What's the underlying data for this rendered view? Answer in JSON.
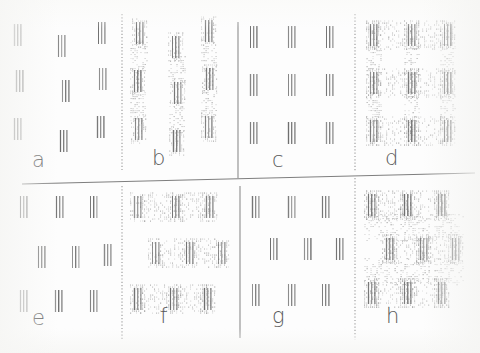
{
  "figure": {
    "width": 480,
    "height": 353,
    "background_color": "#fdfdfd",
    "element_stroke_color": "#6d6d6d",
    "connector_dot_color": "#b9b9b9",
    "divider_color": "#8d8d8d",
    "label_color": "#5a5a5a"
  },
  "dividers": {
    "vertical_dotted_left": {
      "x": 122,
      "y1": 14,
      "y2": 170,
      "style": "dotted"
    },
    "vertical_solid_center_top": {
      "x": 238,
      "y1": 22,
      "y2": 178,
      "style": "solid"
    },
    "vertical_dotted_right_top": {
      "x": 355,
      "y1": 14,
      "y2": 172,
      "style": "dotted"
    },
    "vertical_dotted_left_bottom": {
      "x": 122,
      "y1": 186,
      "y2": 340,
      "style": "dotted"
    },
    "vertical_solid_center_bottom": {
      "x": 240,
      "y1": 186,
      "y2": 338,
      "style": "solid"
    },
    "vertical_dotted_right_bottom": {
      "x": 355,
      "y1": 178,
      "y2": 340,
      "style": "dotted"
    },
    "horizontal_main": {
      "x1": 22,
      "y1": 184,
      "x2": 475,
      "y2": 173,
      "style": "solid"
    }
  },
  "panels": [
    {
      "id": "a",
      "label": "a",
      "label_x": 32,
      "label_y": 150,
      "origin_x": 8,
      "origin_y": 14,
      "connectors": "none",
      "arrangement": "jittered-3x3",
      "description": "Three rows of three triple-stroke elements, positions randomly jittered, no connecting texture.",
      "elements": [
        {
          "x": 14,
          "y": 24
        },
        {
          "x": 58,
          "y": 35
        },
        {
          "x": 98,
          "y": 22
        },
        {
          "x": 16,
          "y": 70
        },
        {
          "x": 62,
          "y": 80
        },
        {
          "x": 99,
          "y": 68
        },
        {
          "x": 14,
          "y": 118
        },
        {
          "x": 60,
          "y": 130
        },
        {
          "x": 97,
          "y": 116
        }
      ]
    },
    {
      "id": "b",
      "label": "b",
      "label_x": 152,
      "label_y": 152,
      "origin_x": 126,
      "origin_y": 14,
      "connectors": "vertical",
      "arrangement": "jittered-3x3",
      "description": "Same jittered elements as panel a but joined by dotted vertical connecting bands down each column.",
      "elements": [
        {
          "x": 136,
          "y": 22
        },
        {
          "x": 172,
          "y": 36
        },
        {
          "x": 205,
          "y": 20
        },
        {
          "x": 134,
          "y": 70
        },
        {
          "x": 174,
          "y": 82
        },
        {
          "x": 206,
          "y": 68
        },
        {
          "x": 135,
          "y": 118
        },
        {
          "x": 173,
          "y": 130
        },
        {
          "x": 205,
          "y": 116
        }
      ]
    },
    {
      "id": "c",
      "label": "c",
      "label_x": 272,
      "label_y": 150,
      "origin_x": 244,
      "origin_y": 14,
      "connectors": "none",
      "arrangement": "regular-3x3",
      "description": "Perfectly regular 3 by 3 lattice of triple-stroke elements, no connecting texture.",
      "elements": [
        {
          "x": 250,
          "y": 26
        },
        {
          "x": 288,
          "y": 26
        },
        {
          "x": 326,
          "y": 26
        },
        {
          "x": 250,
          "y": 74
        },
        {
          "x": 288,
          "y": 74
        },
        {
          "x": 326,
          "y": 74
        },
        {
          "x": 250,
          "y": 122
        },
        {
          "x": 288,
          "y": 122
        },
        {
          "x": 326,
          "y": 122
        }
      ]
    },
    {
      "id": "d",
      "label": "d",
      "label_x": 385,
      "label_y": 152,
      "origin_x": 360,
      "origin_y": 14,
      "connectors": "lattice",
      "arrangement": "regular-3x3",
      "description": "Regular 3 by 3 lattice with a full dotted grid of horizontal and vertical connecting bands.",
      "elements": [
        {
          "x": 370,
          "y": 24
        },
        {
          "x": 408,
          "y": 24
        },
        {
          "x": 444,
          "y": 24
        },
        {
          "x": 370,
          "y": 72
        },
        {
          "x": 408,
          "y": 72
        },
        {
          "x": 444,
          "y": 72
        },
        {
          "x": 370,
          "y": 120
        },
        {
          "x": 408,
          "y": 120
        },
        {
          "x": 444,
          "y": 120
        }
      ]
    },
    {
      "id": "e",
      "label": "e",
      "label_x": 32,
      "label_y": 310,
      "origin_x": 8,
      "origin_y": 190,
      "connectors": "none",
      "arrangement": "row-shifted",
      "description": "Three rows of three elements with the middle row displaced sideways, no connecting texture.",
      "elements": [
        {
          "x": 20,
          "y": 196
        },
        {
          "x": 56,
          "y": 196
        },
        {
          "x": 90,
          "y": 196
        },
        {
          "x": 38,
          "y": 246
        },
        {
          "x": 72,
          "y": 246
        },
        {
          "x": 104,
          "y": 244
        },
        {
          "x": 20,
          "y": 290
        },
        {
          "x": 55,
          "y": 290
        },
        {
          "x": 90,
          "y": 290
        }
      ]
    },
    {
      "id": "f",
      "label": "f",
      "label_x": 160,
      "label_y": 312,
      "origin_x": 126,
      "origin_y": 190,
      "connectors": "horizontal",
      "arrangement": "row-shifted",
      "description": "Row-shifted elements joined by dotted horizontal connecting bands along each row.",
      "elements": [
        {
          "x": 134,
          "y": 196
        },
        {
          "x": 172,
          "y": 196
        },
        {
          "x": 206,
          "y": 196
        },
        {
          "x": 152,
          "y": 242
        },
        {
          "x": 186,
          "y": 242
        },
        {
          "x": 218,
          "y": 242
        },
        {
          "x": 134,
          "y": 288
        },
        {
          "x": 170,
          "y": 288
        },
        {
          "x": 204,
          "y": 288
        }
      ]
    },
    {
      "id": "g",
      "label": "g",
      "label_x": 272,
      "label_y": 310,
      "origin_x": 244,
      "origin_y": 190,
      "connectors": "none",
      "arrangement": "row-shifted",
      "description": "Row-shifted lattice of elements on the right of the lower half, no connecting texture.",
      "elements": [
        {
          "x": 252,
          "y": 196
        },
        {
          "x": 288,
          "y": 196
        },
        {
          "x": 322,
          "y": 196
        },
        {
          "x": 270,
          "y": 238
        },
        {
          "x": 304,
          "y": 238
        },
        {
          "x": 336,
          "y": 238
        },
        {
          "x": 252,
          "y": 284
        },
        {
          "x": 288,
          "y": 284
        },
        {
          "x": 322,
          "y": 284
        }
      ]
    },
    {
      "id": "h",
      "label": "h",
      "label_x": 386,
      "label_y": 312,
      "origin_x": 360,
      "origin_y": 190,
      "connectors": "lattice",
      "arrangement": "row-shifted",
      "description": "Row-shifted lattice joined by a full dotted connecting grid, producing a sheared lattice appearance.",
      "elements": [
        {
          "x": 368,
          "y": 194
        },
        {
          "x": 404,
          "y": 194
        },
        {
          "x": 438,
          "y": 194
        },
        {
          "x": 386,
          "y": 238
        },
        {
          "x": 420,
          "y": 238
        },
        {
          "x": 452,
          "y": 238
        },
        {
          "x": 368,
          "y": 282
        },
        {
          "x": 404,
          "y": 282
        },
        {
          "x": 438,
          "y": 282
        }
      ]
    }
  ],
  "element_spec": {
    "stroke_count": 3,
    "stroke_spacing": 3.2,
    "stroke_height": 22,
    "description": "Each stimulus element is three short parallel vertical strokes."
  }
}
